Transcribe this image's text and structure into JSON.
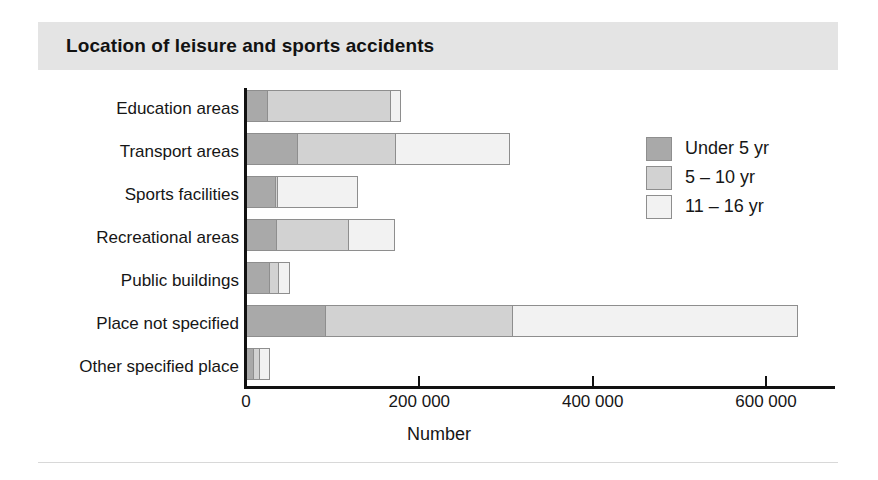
{
  "header": {
    "title": "Location of leisure and sports accidents"
  },
  "chart_data": {
    "type": "bar",
    "orientation": "horizontal",
    "stacked": true,
    "title": "Location of leisure and sports accidents",
    "xlabel": "Number",
    "ylabel": "",
    "xlim": [
      0,
      682000
    ],
    "grid": false,
    "legend_position": "right-inside",
    "categories": [
      "Education areas",
      "Transport areas",
      "Sports facilities",
      "Recreational areas",
      "Public buildings",
      "Place not specified",
      "Other specified place"
    ],
    "tick_labels": [
      "0",
      "200 000",
      "400 000",
      "600 000"
    ],
    "tick_values": [
      0,
      200000,
      400000,
      600000
    ],
    "series": [
      {
        "name": "Under 5 yr",
        "color": "#a9a9a9",
        "values": [
          27000,
          61000,
          36000,
          37000,
          29000,
          93000,
          10000
        ]
      },
      {
        "name": "5 – 10 yr",
        "color": "#d2d2d2",
        "values": [
          143000,
          114000,
          3000,
          84000,
          11000,
          217000,
          9000
        ]
      },
      {
        "name": "11 – 16 yr",
        "color": "#f2f2f2",
        "values": [
          12000,
          133000,
          94000,
          54000,
          14000,
          330000,
          12000
        ]
      }
    ],
    "totals": [
      182000,
      308000,
      133000,
      175000,
      54000,
      640000,
      31000
    ]
  }
}
